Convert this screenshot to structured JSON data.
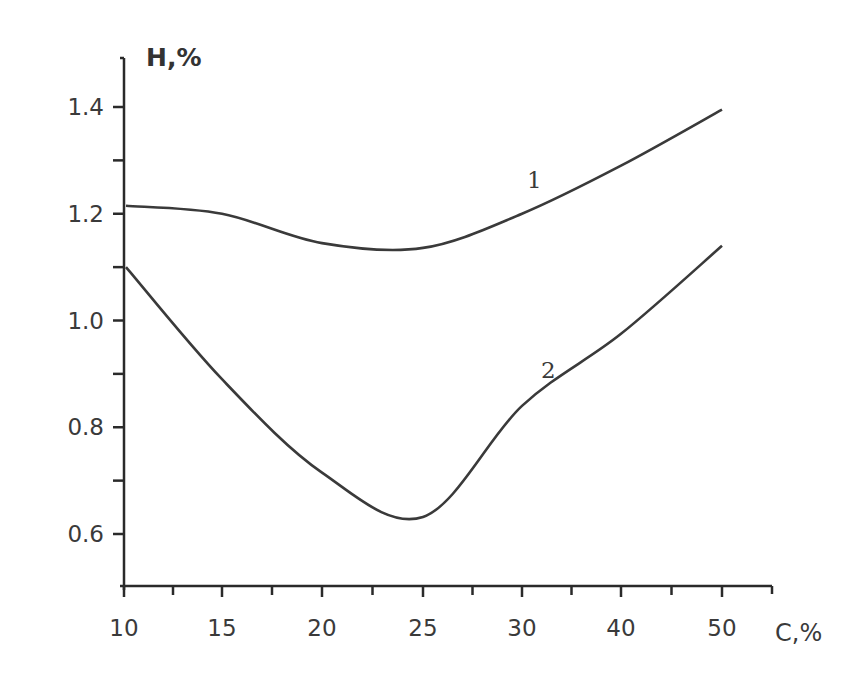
{
  "chart_data": {
    "type": "line",
    "title": "",
    "xlabel": "C,%",
    "ylabel": "H,%",
    "x": [
      10,
      15,
      20,
      25,
      30,
      40,
      50
    ],
    "x_tick_labels": [
      "10",
      "15",
      "20",
      "25",
      "30",
      "40",
      "50"
    ],
    "y_tick_labels": [
      "0.6",
      "0.8",
      "1.0",
      "1.2",
      "1.4"
    ],
    "ylim": [
      0.5,
      1.5
    ],
    "grid": false,
    "legend": "none (curves labeled inline as 1 and 2)",
    "series": [
      {
        "name": "1",
        "values": [
          1.215,
          1.2,
          1.145,
          1.136,
          1.2,
          1.29,
          1.395
        ]
      },
      {
        "name": "2",
        "values": [
          1.1,
          0.89,
          0.715,
          0.632,
          0.84,
          0.975,
          1.14
        ]
      }
    ]
  },
  "labels": {
    "y_axis_title": "H,%",
    "x_axis_title": "C,%",
    "curve1": "1",
    "curve2": "2"
  },
  "colors": {
    "axis": "#2a2a2a",
    "curve": "#3a3a3a",
    "background": "#ffffff"
  }
}
